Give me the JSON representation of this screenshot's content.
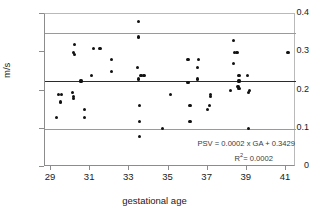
{
  "figure": {
    "background": "#ffffff",
    "point_color": "#111111",
    "mean_line_color": "#2b2b2b",
    "limit_line_color": "#9a9a9a",
    "axis_color": "#8c8c8c"
  },
  "annotations": {
    "equation": "PSV = 0.0002 x GA + 0.3429",
    "r_squared_prefix": "R",
    "r_squared_sup": "2",
    "r_squared_value": "= 0.0002"
  },
  "chart_data": {
    "type": "scatter",
    "title": "",
    "xlabel": "gestational age",
    "ylabel": "m/s",
    "xlim": [
      29,
      41
    ],
    "ylim": [
      0,
      0.4
    ],
    "xticks": [
      29,
      31,
      33,
      35,
      37,
      39,
      41
    ],
    "xtick_labels": [
      "29",
      "31",
      "33",
      "35",
      "37",
      "39",
      "41"
    ],
    "yticks": [
      0,
      0.1,
      0.2,
      0.3,
      0.4
    ],
    "ytick_labels": [
      "0",
      "0.1",
      "0.2",
      "0.3",
      "0.4"
    ],
    "grid": false,
    "legend": false,
    "series": [
      {
        "name": "PSV measurements",
        "marker": "diamond",
        "points": [
          [
            29.3,
            0.13
          ],
          [
            29.4,
            0.19
          ],
          [
            29.55,
            0.19
          ],
          [
            29.5,
            0.17
          ],
          [
            30.2,
            0.32
          ],
          [
            30.15,
            0.3
          ],
          [
            30.2,
            0.295
          ],
          [
            30.1,
            0.195
          ],
          [
            30.15,
            0.185
          ],
          [
            30.15,
            0.18
          ],
          [
            30.5,
            0.225
          ],
          [
            30.55,
            0.225
          ],
          [
            30.7,
            0.15
          ],
          [
            30.7,
            0.13
          ],
          [
            31.05,
            0.24
          ],
          [
            31.15,
            0.31
          ],
          [
            31.5,
            0.31
          ],
          [
            32.1,
            0.28
          ],
          [
            32.1,
            0.25
          ],
          [
            33.45,
            0.38
          ],
          [
            33.45,
            0.34
          ],
          [
            33.4,
            0.26
          ],
          [
            33.45,
            0.23
          ],
          [
            33.6,
            0.24
          ],
          [
            33.75,
            0.24
          ],
          [
            33.5,
            0.16
          ],
          [
            33.5,
            0.12
          ],
          [
            33.5,
            0.08
          ],
          [
            34.7,
            0.1
          ],
          [
            35.1,
            0.19
          ],
          [
            36.0,
            0.28
          ],
          [
            36.0,
            0.22
          ],
          [
            36.1,
            0.16
          ],
          [
            36.1,
            0.12
          ],
          [
            36.55,
            0.28
          ],
          [
            36.5,
            0.26
          ],
          [
            36.5,
            0.23
          ],
          [
            37.15,
            0.19
          ],
          [
            37.15,
            0.185
          ],
          [
            37.1,
            0.16
          ],
          [
            37.0,
            0.15
          ],
          [
            38.15,
            0.2
          ],
          [
            38.35,
            0.3
          ],
          [
            38.5,
            0.3
          ],
          [
            38.3,
            0.33
          ],
          [
            38.3,
            0.27
          ],
          [
            38.6,
            0.24
          ],
          [
            38.6,
            0.225
          ],
          [
            38.55,
            0.21
          ],
          [
            38.6,
            0.205
          ],
          [
            39.05,
            0.24
          ],
          [
            39.15,
            0.2
          ],
          [
            39.1,
            0.195
          ],
          [
            39.1,
            0.1
          ],
          [
            41.1,
            0.3
          ]
        ]
      }
    ],
    "reference_lines": [
      {
        "name": "upper-limit",
        "value": 0.35,
        "style": "thin"
      },
      {
        "name": "mean",
        "value": 0.224,
        "style": "thick"
      },
      {
        "name": "lower-limit",
        "value": 0.097,
        "style": "thin"
      }
    ]
  }
}
